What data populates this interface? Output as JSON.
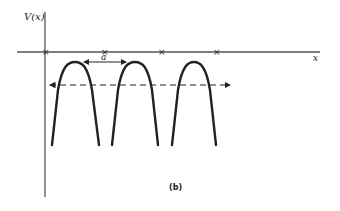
{
  "figure": {
    "y_axis_label": "V(x)",
    "x_axis_label": "x",
    "spacing_label": "a",
    "panel_label": "(b)"
  },
  "colors": {
    "background": "#ffffff",
    "ink": "#222222",
    "axis": "#555555"
  },
  "lattice": {
    "site_marker": "×",
    "site_x_positions": [
      45,
      104,
      161,
      216
    ],
    "axis_y": 52
  },
  "potential_humps": [
    {
      "left": 52,
      "peak_x": 75,
      "right": 99,
      "peak_y": 62,
      "base_y": 145
    },
    {
      "left": 112,
      "peak_x": 135,
      "right": 158,
      "peak_y": 62,
      "base_y": 145
    },
    {
      "left": 172,
      "peak_x": 194,
      "right": 216,
      "peak_y": 62,
      "base_y": 145
    }
  ],
  "energy_level": {
    "style": "dashed",
    "y": 85,
    "x_start": 48,
    "x_end": 232,
    "arrows": "both"
  }
}
